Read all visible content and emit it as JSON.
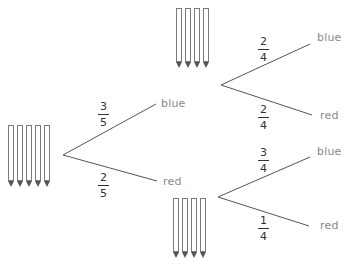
{
  "diagram": {
    "type": "probability-tree",
    "colors": {
      "line": "#555555",
      "label": "#8a8a8a",
      "fraction": "#333333",
      "pencil_tip": "#555555"
    },
    "root": {
      "pencil_count": 5,
      "branches": [
        {
          "label": "blue",
          "probability": {
            "numerator": "3",
            "denominator": "5"
          }
        },
        {
          "label": "red",
          "probability": {
            "numerator": "2",
            "denominator": "5"
          }
        }
      ]
    },
    "after_blue": {
      "pencil_count": 4,
      "branches": [
        {
          "label": "blue",
          "probability": {
            "numerator": "2",
            "denominator": "4"
          }
        },
        {
          "label": "red",
          "probability": {
            "numerator": "2",
            "denominator": "4"
          }
        }
      ]
    },
    "after_red": {
      "pencil_count": 4,
      "branches": [
        {
          "label": "blue",
          "probability": {
            "numerator": "3",
            "denominator": "4"
          }
        },
        {
          "label": "red",
          "probability": {
            "numerator": "1",
            "denominator": "4"
          }
        }
      ]
    }
  }
}
